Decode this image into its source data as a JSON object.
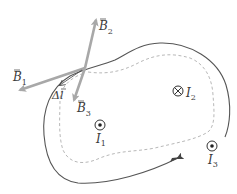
{
  "diagram": {
    "type": "ampere-loop",
    "labels": {
      "b1": "B",
      "b1_sub": "1",
      "b2": "B",
      "b2_sub": "2",
      "b3": "B",
      "b3_sub": "3",
      "dl": "Δl",
      "i1": "I",
      "i1_sub": "1",
      "i2": "I",
      "i2_sub": "2",
      "i3": "I",
      "i3_sub": "3"
    },
    "currents": [
      {
        "name": "I1",
        "direction": "out-of-page",
        "symbol": "dot"
      },
      {
        "name": "I2",
        "direction": "into-page",
        "symbol": "cross"
      },
      {
        "name": "I3",
        "direction": "out-of-page",
        "symbol": "dot"
      }
    ],
    "colors": {
      "loop": "#555555",
      "dashed_path": "#b8b8b8",
      "vector": "#a8a8a8",
      "text": "#3a3a3a"
    }
  }
}
